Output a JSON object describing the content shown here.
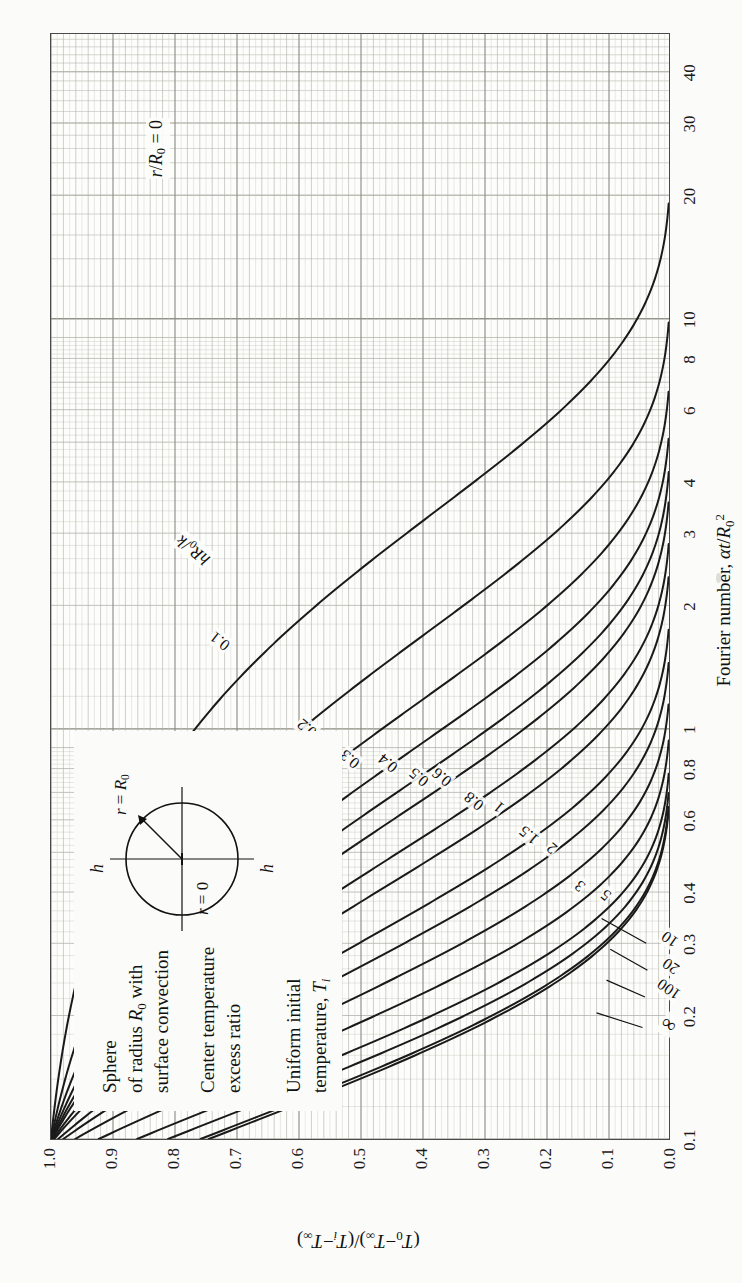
{
  "figure": {
    "background_color": "#fbfbf9",
    "frame_color": "#4a4a4a",
    "curve_color": "#1a1a1a"
  },
  "legend": {
    "line1": "Sphere",
    "line2": "of radius R0 with",
    "line3": "surface convection",
    "line4": "Center temperature",
    "line5": "excess ratio",
    "line6": "Uniform initial",
    "line7": "temperature, Ti",
    "diagram": {
      "h_top": "h",
      "h_bottom": "h",
      "r_surface": "r = R0",
      "r_center": "r = 0"
    }
  },
  "annotations": {
    "radius_ratio": "r/R0 = 0",
    "parameter_symbol": "hR0/k"
  },
  "chart_data": {
    "type": "line",
    "xlabel": "Fourier number, αt/R0²",
    "ylabel": "(T0−T∞)/(Ti−T∞)",
    "xscale": "log",
    "yscale": "linear",
    "xlim": [
      0.1,
      50
    ],
    "ylim": [
      0.0,
      1.0
    ],
    "grid": true,
    "legend_position": "inline-curve-labels",
    "xticks": [
      0.1,
      0.2,
      0.3,
      0.4,
      0.6,
      0.8,
      1,
      2,
      3,
      4,
      6,
      8,
      10,
      20,
      30,
      40
    ],
    "xticklabels": [
      "0.1",
      "0.2",
      "0.3",
      "0.4",
      "0.6",
      "0.8",
      "1",
      "2",
      "3",
      "4",
      "6",
      "8",
      "10",
      "20",
      "30",
      "40"
    ],
    "yticks": [
      0.0,
      0.1,
      0.2,
      0.3,
      0.4,
      0.5,
      0.6,
      0.7,
      0.8,
      0.9,
      1.0
    ],
    "yticklabels": [
      "0.0",
      "0.1",
      "0.2",
      "0.3",
      "0.4",
      "0.5",
      "0.6",
      "0.7",
      "0.8",
      "0.9",
      "1.0"
    ],
    "series_parameter": "hR0/k",
    "series": [
      {
        "name": "0.1",
        "Bi": 0.1,
        "C1": 1.0298,
        "lam1": 0.5423
      },
      {
        "name": "0.2",
        "Bi": 0.2,
        "C1": 1.0592,
        "lam1": 0.7593
      },
      {
        "name": "0.3",
        "Bi": 0.3,
        "C1": 1.088,
        "lam1": 0.9208
      },
      {
        "name": "0.4",
        "Bi": 0.4,
        "C1": 1.1164,
        "lam1": 1.0528
      },
      {
        "name": "0.5",
        "Bi": 0.5,
        "C1": 1.1441,
        "lam1": 1.1656
      },
      {
        "name": "0.6",
        "Bi": 0.6,
        "C1": 1.1713,
        "lam1": 1.2644
      },
      {
        "name": "0.8",
        "Bi": 0.8,
        "C1": 1.2236,
        "lam1": 1.432
      },
      {
        "name": "1",
        "Bi": 1.0,
        "C1": 1.2732,
        "lam1": 1.5708
      },
      {
        "name": "1.5",
        "Bi": 1.5,
        "C1": 1.385,
        "lam1": 1.8366
      },
      {
        "name": "2",
        "Bi": 2.0,
        "C1": 1.4793,
        "lam1": 2.0288
      },
      {
        "name": "3",
        "Bi": 3.0,
        "C1": 1.6227,
        "lam1": 2.2889
      },
      {
        "name": "5",
        "Bi": 5.0,
        "C1": 1.787,
        "lam1": 2.5704
      },
      {
        "name": "10",
        "Bi": 10.0,
        "C1": 1.9249,
        "lam1": 2.8363
      },
      {
        "name": "20",
        "Bi": 20.0,
        "C1": 1.9781,
        "lam1": 2.9857
      },
      {
        "name": "100",
        "Bi": 100.0,
        "C1": 1.9962,
        "lam1": 3.1102
      },
      {
        "name": "∞",
        "Bi": 100000.0,
        "C1": 2.0,
        "lam1": 3.14159
      }
    ],
    "curve_labels": [
      {
        "name": "0.1",
        "x": 1.55,
        "y": 0.74,
        "angle": -52
      },
      {
        "name": "0.2",
        "x": 0.95,
        "y": 0.6,
        "angle": -50
      },
      {
        "name": "0.3",
        "x": 0.8,
        "y": 0.53,
        "angle": -50
      },
      {
        "name": "0.4",
        "x": 0.78,
        "y": 0.47,
        "angle": -50
      },
      {
        "name": "0.5",
        "x": 0.72,
        "y": 0.42,
        "angle": -50
      },
      {
        "name": "0.6",
        "x": 0.72,
        "y": 0.382,
        "angle": -50
      },
      {
        "name": "0.8",
        "x": 0.63,
        "y": 0.33,
        "angle": -50
      },
      {
        "name": "1",
        "x": 0.63,
        "y": 0.29,
        "angle": -50
      },
      {
        "name": "1.5",
        "x": 0.52,
        "y": 0.242,
        "angle": -50
      },
      {
        "name": "2",
        "x": 0.5,
        "y": 0.205,
        "angle": -50
      },
      {
        "name": "3",
        "x": 0.405,
        "y": 0.16,
        "angle": -50
      },
      {
        "name": "5",
        "x": 0.385,
        "y": 0.118,
        "angle": -50
      }
    ],
    "leader_labels": [
      {
        "name": "10",
        "lx": 0.3,
        "ly": 0.04,
        "tx": 0.345,
        "ty": 0.112
      },
      {
        "name": "20",
        "lx": 0.258,
        "ly": 0.038,
        "tx": 0.29,
        "ty": 0.098
      },
      {
        "name": "100",
        "lx": 0.222,
        "ly": 0.042,
        "tx": 0.244,
        "ty": 0.104
      },
      {
        "name": "∞",
        "lx": 0.187,
        "ly": 0.046,
        "tx": 0.203,
        "ty": 0.12
      }
    ]
  }
}
